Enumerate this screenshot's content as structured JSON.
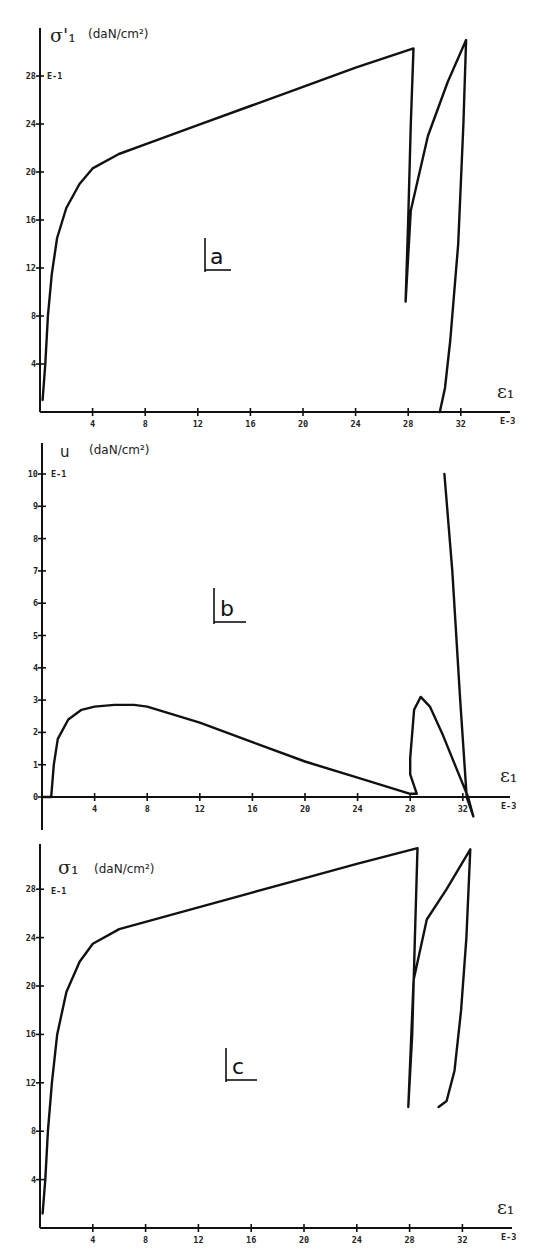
{
  "figure": {
    "panels": [
      {
        "id": "a",
        "letter": "a",
        "y_symbol": "σ'₁",
        "y_unit": "(daN/cm²)",
        "y_exp": "E-1",
        "x_symbol": "ε₁",
        "x_exp": "E-3",
        "y_ticks": [
          "4",
          "8",
          "12",
          "16",
          "20",
          "24",
          "28"
        ],
        "x_ticks": [
          "4",
          "8",
          "12",
          "16",
          "20",
          "24",
          "28",
          "32"
        ]
      },
      {
        "id": "b",
        "letter": "b",
        "y_symbol": "u",
        "y_unit": "(daN/cm²)",
        "y_exp": "E-1",
        "x_symbol": "ε₁",
        "x_exp": "E-3",
        "y_ticks": [
          "0",
          "1",
          "2",
          "3",
          "4",
          "5",
          "6",
          "7",
          "8",
          "9",
          "10"
        ],
        "x_ticks": [
          "4",
          "8",
          "12",
          "16",
          "20",
          "24",
          "28",
          "32"
        ]
      },
      {
        "id": "c",
        "letter": "c",
        "y_symbol": "σ₁",
        "y_unit": "(daN/cm²)",
        "y_exp": "E-1",
        "x_symbol": "ε₁",
        "x_exp": "E-3",
        "y_ticks": [
          "4",
          "8",
          "12",
          "16",
          "20",
          "24",
          "28"
        ],
        "x_ticks": [
          "4",
          "8",
          "12",
          "16",
          "20",
          "24",
          "28",
          "32"
        ]
      }
    ]
  },
  "chart_data": [
    {
      "type": "line",
      "title": "a",
      "xlabel": "ε1 (E-3)",
      "ylabel": "σ'1 (daN/cm²) (E-1)",
      "xlim": [
        0,
        34
      ],
      "ylim": [
        0,
        31
      ],
      "x_ticks": [
        4,
        8,
        12,
        16,
        20,
        24,
        28,
        32
      ],
      "y_ticks": [
        4,
        8,
        12,
        16,
        20,
        24,
        28
      ],
      "grid": false,
      "series": [
        {
          "name": "effective axial stress",
          "x": [
            0.2,
            0.4,
            0.6,
            0.9,
            1.3,
            2.0,
            3.0,
            4.0,
            6.0,
            8.0,
            12.0,
            16.0,
            20.0,
            24.0,
            28.4,
            28.2,
            28.0,
            27.8,
            28.2,
            29.5,
            31.0,
            32.4,
            32.2,
            31.8,
            31.2,
            30.8,
            30.4
          ],
          "y": [
            1.0,
            4.0,
            8.0,
            11.5,
            14.5,
            17.0,
            19.0,
            20.3,
            21.5,
            22.3,
            23.9,
            25.5,
            27.1,
            28.7,
            30.3,
            24.0,
            16.0,
            9.2,
            16.8,
            23.0,
            27.5,
            31.0,
            24.0,
            14.0,
            6.0,
            2.0,
            0.0
          ]
        }
      ]
    },
    {
      "type": "line",
      "title": "b",
      "xlabel": "ε1 (E-3)",
      "ylabel": "u (daN/cm²) (E-1)",
      "xlim": [
        0,
        34
      ],
      "ylim": [
        -0.9,
        10.5
      ],
      "x_ticks": [
        4,
        8,
        12,
        16,
        20,
        24,
        28,
        32
      ],
      "y_ticks": [
        0,
        1,
        2,
        3,
        4,
        5,
        6,
        7,
        8,
        9,
        10
      ],
      "grid": false,
      "series": [
        {
          "name": "pore pressure",
          "x": [
            0.0,
            0.7,
            0.9,
            1.2,
            2.0,
            3.0,
            4.0,
            5.5,
            7.0,
            8.0,
            12.0,
            16.0,
            20.0,
            24.0,
            28.0,
            28.5,
            28.0,
            28.0,
            28.3,
            28.8,
            29.5,
            30.5,
            31.5,
            32.4,
            32.8,
            32.3,
            31.8,
            31.2,
            30.6
          ],
          "y": [
            0.0,
            0.0,
            1.0,
            1.8,
            2.4,
            2.7,
            2.8,
            2.85,
            2.85,
            2.8,
            2.3,
            1.7,
            1.1,
            0.6,
            0.1,
            0.1,
            0.7,
            1.2,
            2.7,
            3.1,
            2.8,
            1.9,
            0.9,
            0.0,
            -0.6,
            0.0,
            3.0,
            7.0,
            10.0
          ]
        }
      ]
    },
    {
      "type": "line",
      "title": "c",
      "xlabel": "ε1 (E-3)",
      "ylabel": "σ1 (daN/cm²) (E-1)",
      "xlim": [
        0,
        34
      ],
      "ylim": [
        0,
        31
      ],
      "x_ticks": [
        4,
        8,
        12,
        16,
        20,
        24,
        28,
        32
      ],
      "y_ticks": [
        4,
        8,
        12,
        16,
        20,
        24,
        28
      ],
      "grid": false,
      "series": [
        {
          "name": "total axial stress",
          "x": [
            0.2,
            0.4,
            0.6,
            0.9,
            1.3,
            2.0,
            3.0,
            4.0,
            6.0,
            8.0,
            12.0,
            16.0,
            20.0,
            24.0,
            28.6,
            28.4,
            28.2,
            27.9,
            28.3,
            29.3,
            30.8,
            32.6,
            32.3,
            31.9,
            31.4,
            30.8,
            30.2
          ],
          "y": [
            1.2,
            4.0,
            8.0,
            12.0,
            16.0,
            19.5,
            22.0,
            23.5,
            24.7,
            25.3,
            26.5,
            27.7,
            28.9,
            30.1,
            31.4,
            24.0,
            16.0,
            10.0,
            20.5,
            25.5,
            28.0,
            31.3,
            24.0,
            18.0,
            13.0,
            10.5,
            10.0
          ]
        }
      ]
    }
  ]
}
